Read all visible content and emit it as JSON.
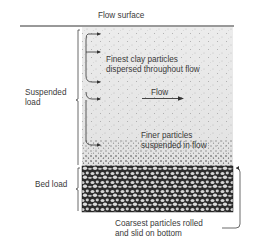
{
  "diagram": {
    "labels": {
      "flow_surface": "Flow surface",
      "suspended_load_line1": "Suspended",
      "suspended_load_line2": "load",
      "bed_load": "Bed load",
      "finest_line1": "Finest clay particles",
      "finest_line2": "dispersed throughout flow",
      "flow": "Flow",
      "finer_line1": "Finer particles",
      "finer_line2": "suspended in flow",
      "coarsest_line1": "Coarsest particles rolled",
      "coarsest_line2": "and slid on bottom"
    },
    "colors": {
      "water": "#e8e8e8",
      "dots": "#6a6a6a",
      "bed": "#2a2a2a",
      "pebble": "#d4d4d4",
      "line": "#333333"
    }
  }
}
